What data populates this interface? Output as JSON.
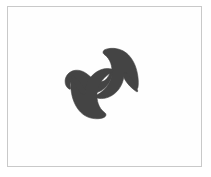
{
  "figure": {
    "title": "Abstract S-shaped double-hook glyph",
    "background_color": "#ffffff",
    "frame": {
      "border_color": "#c9c9c9",
      "fill_color": "#fefefe",
      "border_width_px": 1,
      "x": 7,
      "y": 6,
      "width": 195,
      "height": 161
    },
    "shape": {
      "name": "double-hook-pinwheel",
      "fill_color": "#444444",
      "symmetry": "180-degree rotational",
      "bounding_box": {
        "x": 66,
        "y": 47,
        "width": 72,
        "height": 76
      },
      "center": {
        "x": 102,
        "y": 85
      },
      "description": "Dark gray S-curve band terminating in two pointed barbed hooks, one opening downward at upper right and one opening upward at lower left",
      "path": "M 121.5 47.5 C 130.5 48.6 136.0 55.0 137.6 63.5 C 139.2 72.0 138.6 79.4 137.4 84.2 C 136.9 86.2 135.9 86.4 135.2 84.8 C 133.2 80.3 130.6 75.4 127.2 72.0 C 126.2 71.0 125.2 71.4 125.0 72.9 C 124.2 79.6 121.2 85.8 116.0 90.3 C 110.6 95.0 104.6 96.4 99.6 95.3 C 95.0 94.3 91.6 91.6 88.4 88.3 C 85.6 85.4 82.8 83.4 79.6 84.3 C 77.6 84.9 76.9 86.4 77.4 88.2 C 77.9 90.0 79.2 91.7 80.4 93.6 C 81.3 95.0 80.6 95.9 79.0 95.6 C 74.8 94.8 70.8 92.4 68.2 88.6 C 66.4 86.0 67.2 84.5 69.4 85.2 C 72.0 86.0 74.4 87.6 76.6 89.6 C 76.6 89.6 76.4 89.2 76.4 89.0 C 75.6 85.0 76.8 81.4 79.8 79.4 C 83.6 76.9 88.6 77.9 92.6 80.8 C 95.4 82.8 97.8 85.4 100.6 87.0 C 104.2 89.1 108.0 88.4 110.8 85.4 C 113.4 82.6 114.6 78.6 114.8 74.4 C 115.0 69.6 114.2 64.8 113.6 60.8 C 112.6 54.0 114.4 49.2 118.6 47.8 C 119.5 47.5 120.5 47.4 121.5 47.5 Z"
    }
  }
}
